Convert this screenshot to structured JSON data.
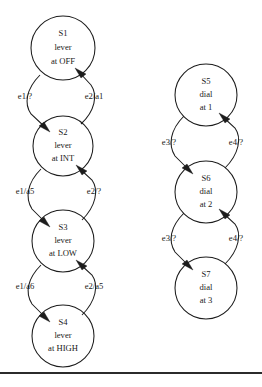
{
  "diagram": {
    "type": "state-transition-diagram",
    "width": 262,
    "height": 387,
    "stroke_color": "#1c1c1c",
    "text_color": "#1a1a1a",
    "background_color": "#ffffff",
    "states": [
      {
        "id": "S1",
        "name": "S1",
        "line1": "lever",
        "line2": "at OFF",
        "cx": 63,
        "cy": 48,
        "r": 32
      },
      {
        "id": "S2",
        "name": "S2",
        "line1": "lever",
        "line2": "at INT",
        "cx": 63,
        "cy": 146,
        "r": 30
      },
      {
        "id": "S3",
        "name": "S3",
        "line1": "lever",
        "line2": "at LOW",
        "cx": 63,
        "cy": 241,
        "r": 31
      },
      {
        "id": "S4",
        "name": "S4",
        "line1": "lever",
        "line2": "at HIGH",
        "cx": 63,
        "cy": 336,
        "r": 31
      },
      {
        "id": "S5",
        "name": "S5",
        "line1": "dial",
        "line2": "at 1",
        "cx": 206,
        "cy": 95,
        "r": 31
      },
      {
        "id": "S6",
        "name": "S6",
        "line1": "dial",
        "line2": "at 2",
        "cx": 206,
        "cy": 192,
        "r": 31
      },
      {
        "id": "S7",
        "name": "S7",
        "line1": "dial",
        "line2": "at 3",
        "cx": 206,
        "cy": 288,
        "r": 31
      }
    ],
    "transitions": [
      {
        "id": "t1",
        "from": "S1",
        "to": "S2",
        "label": "e1/?",
        "label_x": 25,
        "label_y": 97,
        "direction": "down"
      },
      {
        "id": "t2",
        "from": "S2",
        "to": "S1",
        "label": "e2/a1",
        "label_x": 94,
        "label_y": 97,
        "direction": "up"
      },
      {
        "id": "t3",
        "from": "S2",
        "to": "S3",
        "label": "e1/a5",
        "label_x": 25,
        "label_y": 192,
        "direction": "down"
      },
      {
        "id": "t4",
        "from": "S3",
        "to": "S2",
        "label": "e2/?",
        "label_x": 94,
        "label_y": 192,
        "direction": "up"
      },
      {
        "id": "t5",
        "from": "S3",
        "to": "S4",
        "label": "e1/a6",
        "label_x": 25,
        "label_y": 287,
        "direction": "down"
      },
      {
        "id": "t6",
        "from": "S4",
        "to": "S3",
        "label": "e2/a5",
        "label_x": 94,
        "label_y": 287,
        "direction": "up"
      },
      {
        "id": "t7",
        "from": "S5",
        "to": "S6",
        "label": "e3/?",
        "label_x": 169,
        "label_y": 143,
        "direction": "down"
      },
      {
        "id": "t8",
        "from": "S6",
        "to": "S5",
        "label": "e4/?",
        "label_x": 236,
        "label_y": 143,
        "direction": "up"
      },
      {
        "id": "t9",
        "from": "S6",
        "to": "S7",
        "label": "e3/?",
        "label_x": 169,
        "label_y": 239,
        "direction": "down"
      },
      {
        "id": "t10",
        "from": "S7",
        "to": "S6",
        "label": "e4/?",
        "label_x": 236,
        "label_y": 239,
        "direction": "up"
      }
    ],
    "footer_rule": {
      "y": 372,
      "color": "#2b2b2b",
      "thickness": 2
    }
  }
}
